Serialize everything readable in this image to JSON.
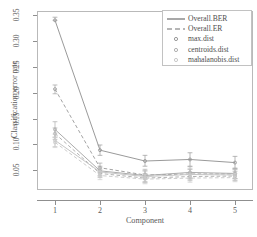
{
  "chart_data": {
    "type": "line",
    "title": "",
    "xlabel": "Component",
    "ylabel": "Classification error rate",
    "x": [
      1,
      2,
      3,
      4,
      5
    ],
    "xticklabels": [
      "1",
      "2",
      "3",
      "4",
      "5"
    ],
    "yticks": [
      0.05,
      0.1,
      0.15,
      0.2,
      0.25,
      0.3,
      0.35
    ],
    "yticklabels": [
      "0.05",
      "0.10",
      "0.15",
      "0.20",
      "0.25",
      "0.30",
      "0.35"
    ],
    "xlim": [
      0.6,
      5.4
    ],
    "ylim": [
      0.012,
      0.358
    ],
    "grid": false,
    "legend_position": "top-right",
    "series": [
      {
        "name": "max.dist Overall.BER",
        "distance": "max.dist",
        "metric": "Overall.BER",
        "linestyle": "solid",
        "color": "#9a9a9a",
        "marker": "point",
        "values": [
          0.34,
          0.089,
          0.068,
          0.071,
          0.065
        ],
        "err_low": [
          0.34,
          0.079,
          0.058,
          0.058,
          0.054
        ],
        "err_high": [
          0.346,
          0.099,
          0.079,
          0.084,
          0.077
        ]
      },
      {
        "name": "max.dist Overall.ER",
        "distance": "max.dist",
        "metric": "Overall.ER",
        "linestyle": "dashed",
        "color": "#a3a3a3",
        "marker": "point",
        "values": [
          0.207,
          0.055,
          0.041,
          0.043,
          0.043
        ],
        "err_low": [
          0.198,
          0.046,
          0.033,
          0.034,
          0.034
        ],
        "err_high": [
          0.215,
          0.064,
          0.049,
          0.052,
          0.052
        ]
      },
      {
        "name": "centroids.dist Overall.BER",
        "distance": "centroids.dist",
        "metric": "Overall.BER",
        "linestyle": "solid",
        "color": "#acacac",
        "marker": "point",
        "values": [
          0.129,
          0.049,
          0.04,
          0.046,
          0.044
        ],
        "err_low": [
          0.114,
          0.04,
          0.028,
          0.035,
          0.034
        ],
        "err_high": [
          0.144,
          0.058,
          0.052,
          0.057,
          0.054
        ]
      },
      {
        "name": "centroids.dist Overall.ER",
        "distance": "centroids.dist",
        "metric": "Overall.ER",
        "linestyle": "dashed",
        "color": "#b2b2b2",
        "marker": "point",
        "values": [
          0.121,
          0.044,
          0.035,
          0.038,
          0.039
        ],
        "err_low": [
          0.11,
          0.036,
          0.026,
          0.03,
          0.03
        ],
        "err_high": [
          0.132,
          0.052,
          0.044,
          0.046,
          0.048
        ]
      },
      {
        "name": "mahalanobis.dist Overall.BER",
        "distance": "mahalanobis.dist",
        "metric": "Overall.BER",
        "linestyle": "solid",
        "color": "#c6c6c6",
        "marker": "point",
        "values": [
          0.108,
          0.047,
          0.038,
          0.042,
          0.041
        ],
        "err_low": [
          0.096,
          0.038,
          0.027,
          0.032,
          0.031
        ],
        "err_high": [
          0.12,
          0.056,
          0.049,
          0.053,
          0.051
        ]
      },
      {
        "name": "mahalanobis.dist Overall.ER",
        "distance": "mahalanobis.dist",
        "metric": "Overall.ER",
        "linestyle": "dashed",
        "color": "#cdcdcd",
        "marker": "point",
        "values": [
          0.104,
          0.04,
          0.033,
          0.035,
          0.036
        ],
        "err_low": [
          0.094,
          0.032,
          0.024,
          0.027,
          0.028
        ],
        "err_high": [
          0.114,
          0.048,
          0.042,
          0.043,
          0.044
        ]
      }
    ],
    "legend": [
      {
        "label": "Overall.BER",
        "key": "solid-line",
        "color": "#6e6e6e"
      },
      {
        "label": "Overall.ER",
        "key": "dashed-line",
        "color": "#6e6e6e"
      },
      {
        "label": "max.dist",
        "key": "point",
        "color": "#9a9a9a"
      },
      {
        "label": "centroids.dist",
        "key": "point",
        "color": "#b0b0b0"
      },
      {
        "label": "mahalanobis.dist",
        "key": "point",
        "color": "#c9c9c9"
      }
    ]
  }
}
